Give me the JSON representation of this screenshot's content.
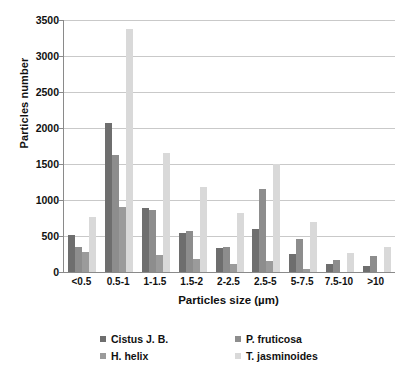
{
  "chart_data": {
    "type": "bar",
    "title": "",
    "subtitle": "",
    "xlabel": "Particles size (µm)",
    "ylabel": "Particles number",
    "categories": [
      "<0.5",
      "0.5-1",
      "1-1.5",
      "1.5-2",
      "2-2.5",
      "2.5-5",
      "5-7.5",
      "7.5-10",
      ">10"
    ],
    "ylim": [
      0,
      3500
    ],
    "yticks": [
      0,
      500,
      1000,
      1500,
      2000,
      2500,
      3000,
      3500
    ],
    "ytick_labels": [
      "0",
      "500",
      "1000",
      "1500",
      "2000",
      "2500",
      "3000",
      "3500"
    ],
    "grid": true,
    "grid_axis": "y",
    "legend_position": "bottom",
    "series": [
      {
        "name": "Cistus J. B.",
        "color": "#6e6e6e",
        "values": [
          510,
          2070,
          885,
          545,
          335,
          600,
          245,
          110,
          85
        ]
      },
      {
        "name": "P. fruticosa",
        "color": "#8d8d8d",
        "values": [
          345,
          1625,
          860,
          565,
          350,
          1150,
          455,
          165,
          220
        ]
      },
      {
        "name": "H. helix",
        "color": "#9b9b9b",
        "values": [
          280,
          900,
          230,
          175,
          105,
          155,
          45,
          0,
          0
        ]
      },
      {
        "name": "T. jasminoides",
        "color": "#d9d9d9",
        "values": [
          760,
          3380,
          1655,
          1180,
          820,
          1500,
          700,
          265,
          345
        ]
      }
    ]
  },
  "legend": {
    "entries": [
      {
        "label": "Cistus J. B.",
        "color": "#6e6e6e"
      },
      {
        "label": "P. fruticosa",
        "color": "#8d8d8d"
      },
      {
        "label": "H. helix",
        "color": "#9b9b9b"
      },
      {
        "label": "T. jasminoides",
        "color": "#d9d9d9"
      }
    ]
  },
  "colors": {
    "background": "#ffffff",
    "axis_line": "#8a8a8a",
    "gridline": "#c9c9c9",
    "text": "#111111"
  }
}
